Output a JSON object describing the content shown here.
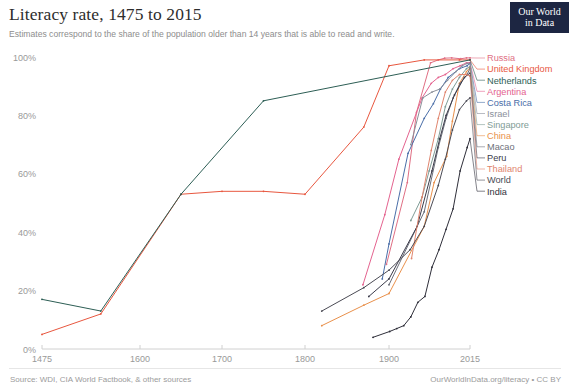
{
  "header": {
    "title": "Literacy rate, 1475 to 2015",
    "subtitle": "Estimates correspond to the share of the population older than 14 years that is able to read and write.",
    "logo_line1": "Our World",
    "logo_line2": "in Data"
  },
  "footer": {
    "source": "Source: WDI, CIA World Factbook, & other sources",
    "attribution": "OurWorldInData.org/literacy • CC BY"
  },
  "chart_data": {
    "type": "line",
    "title": "Literacy rate, 1475 to 2015",
    "subtitle": "Estimates correspond to the share of the population older than 14 years that is able to read and write.",
    "xlabel": "",
    "ylabel": "",
    "xlim": [
      1475,
      2015
    ],
    "ylim": [
      0,
      100
    ],
    "grid": false,
    "legend_position": "right",
    "x_ticks": [
      1475,
      1600,
      1700,
      1800,
      1900,
      2015
    ],
    "x_tick_labels": [
      "1475",
      "1600",
      "1700",
      "1800",
      "1900",
      "2015"
    ],
    "y_ticks": [
      0,
      20,
      40,
      60,
      80,
      100
    ],
    "y_tick_labels": [
      "0%",
      "20%",
      "40%",
      "60%",
      "80%",
      "100%"
    ],
    "series": [
      {
        "name": "Russia",
        "color": "#e06f84",
        "x": [
          1897,
          1926,
          1939,
          1959,
          1970,
          1979,
          1989,
          2002,
          2010,
          2015
        ],
        "values": [
          29,
          57,
          81,
          98,
          99,
          99.6,
          99.7,
          99.4,
          99.7,
          99.7
        ]
      },
      {
        "name": "United Kingdom",
        "color": "#e8573f",
        "x": [
          1475,
          1550,
          1650,
          1700,
          1750,
          1800,
          1870,
          1900,
          1950,
          2000,
          2015
        ],
        "values": [
          5,
          12,
          53,
          54,
          54,
          53,
          76,
          97,
          99,
          99,
          99
        ]
      },
      {
        "name": "Netherlands",
        "color": "#2d5e55",
        "x": [
          1475,
          1550,
          1650,
          1750,
          2015
        ],
        "values": [
          17,
          13,
          53,
          85,
          99
        ]
      },
      {
        "name": "Argentina",
        "color": "#e4638f",
        "x": [
          1869,
          1895,
          1914,
          1947,
          1960,
          1970,
          1980,
          1991,
          2001,
          2010,
          2015
        ],
        "values": [
          22,
          46,
          65,
          86,
          91,
          93,
          94,
          96,
          97,
          98,
          98.1
        ]
      },
      {
        "name": "Costa Rica",
        "color": "#4a6ea8",
        "x": [
          1892,
          1900,
          1927,
          1950,
          1963,
          1973,
          1984,
          2000,
          2011,
          2015
        ],
        "values": [
          24,
          36,
          67,
          79,
          84,
          89,
          93,
          96,
          97,
          97.8
        ]
      },
      {
        "name": "Israel",
        "color": "#8a8f9a",
        "x": [
          1931,
          1948,
          1961,
          1972,
          1983,
          1995,
          2004,
          2011,
          2015
        ],
        "values": [
          70,
          86,
          88,
          89,
          92,
          95,
          97,
          97.8,
          97.8
        ]
      },
      {
        "name": "Singapore",
        "color": "#7f9c96",
        "x": [
          1931,
          1947,
          1957,
          1970,
          1980,
          1990,
          2000,
          2010,
          2015
        ],
        "values": [
          44,
          52,
          61,
          72,
          83,
          89,
          93,
          96,
          96.8
        ]
      },
      {
        "name": "China",
        "color": "#e9904b",
        "x": [
          1820,
          1870,
          1900,
          1950,
          1964,
          1982,
          1990,
          2000,
          2010,
          2015
        ],
        "values": [
          8,
          15,
          19,
          42,
          57,
          66,
          78,
          91,
          95,
          96.4
        ]
      },
      {
        "name": "Macao",
        "color": "#6c6f7a",
        "x": [
          1900,
          1950,
          1970,
          1981,
          1991,
          2001,
          2011,
          2015
        ],
        "values": [
          22,
          47,
          69,
          79,
          86,
          91,
          94,
          96.2
        ]
      },
      {
        "name": "Peru",
        "color": "#3b3b4a",
        "x": [
          1876,
          1900,
          1940,
          1961,
          1972,
          1981,
          1993,
          2007,
          2015
        ],
        "values": [
          18,
          24,
          42,
          61,
          72,
          80,
          87,
          93,
          94.5
        ]
      },
      {
        "name": "Thailand",
        "color": "#e0856e",
        "x": [
          1932,
          1947,
          1960,
          1970,
          1980,
          1990,
          2000,
          2010,
          2015
        ],
        "values": [
          31,
          52,
          68,
          79,
          88,
          92,
          94,
          94,
          93.5
        ]
      },
      {
        "name": "World",
        "color": "#4b4b55",
        "x": [
          1820,
          1870,
          1900,
          1930,
          1950,
          1970,
          1980,
          1990,
          2000,
          2010,
          2015
        ],
        "values": [
          13,
          21,
          27,
          34,
          42,
          56,
          65,
          75,
          82,
          85,
          86
        ]
      },
      {
        "name": "India",
        "color": "#2f2f3a",
        "x": [
          1881,
          1901,
          1911,
          1921,
          1931,
          1941,
          1951,
          1961,
          1971,
          1981,
          1991,
          2001,
          2011,
          2015
        ],
        "values": [
          4,
          6,
          7,
          8,
          11,
          16,
          18,
          28,
          34,
          41,
          48,
          61,
          69,
          72
        ]
      }
    ]
  },
  "legend": {
    "items": [
      {
        "label": "Russia",
        "color": "#e06f84"
      },
      {
        "label": "United Kingdom",
        "color": "#e8573f"
      },
      {
        "label": "Netherlands",
        "color": "#2d5e55"
      },
      {
        "label": "Argentina",
        "color": "#e4638f"
      },
      {
        "label": "Costa Rica",
        "color": "#4a6ea8"
      },
      {
        "label": "Israel",
        "color": "#8a8f9a"
      },
      {
        "label": "Singapore",
        "color": "#7f9c96"
      },
      {
        "label": "China",
        "color": "#e9904b"
      },
      {
        "label": "Macao",
        "color": "#6c6f7a"
      },
      {
        "label": "Peru",
        "color": "#3b3b4a"
      },
      {
        "label": "Thailand",
        "color": "#e0856e"
      },
      {
        "label": "World",
        "color": "#4b4b55"
      },
      {
        "label": "India",
        "color": "#2f2f3a"
      }
    ]
  }
}
